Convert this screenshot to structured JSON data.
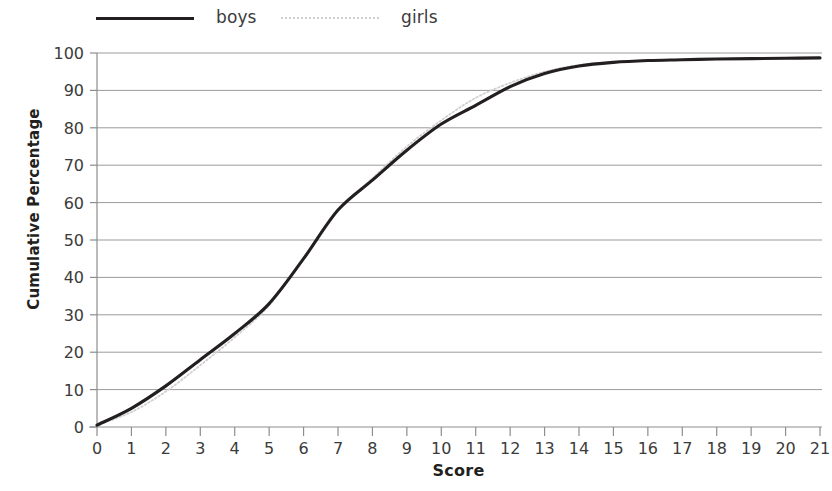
{
  "chart_data": {
    "type": "line",
    "title": "",
    "subtitle": "",
    "xlabel": "Score",
    "ylabel": "Cumulative Percentage",
    "xlim": [
      0,
      21
    ],
    "ylim": [
      0,
      100
    ],
    "x_ticks": [
      0,
      1,
      2,
      3,
      4,
      5,
      6,
      7,
      8,
      9,
      10,
      11,
      12,
      13,
      14,
      15,
      16,
      17,
      18,
      19,
      20,
      21
    ],
    "y_ticks": [
      0,
      10,
      20,
      30,
      40,
      50,
      60,
      70,
      80,
      90,
      100
    ],
    "grid": "horizontal",
    "legend_position": "top-left",
    "x": [
      0,
      1,
      2,
      3,
      4,
      5,
      6,
      7,
      8,
      9,
      10,
      11,
      12,
      13,
      14,
      15,
      16,
      17,
      18,
      19,
      20,
      21
    ],
    "series": [
      {
        "name": "boys",
        "color": "#231f20",
        "style": "solid",
        "values": [
          0.5,
          5,
          11,
          18,
          25,
          33,
          45,
          58,
          66,
          74,
          81,
          86,
          91,
          94.5,
          96.5,
          97.5,
          98,
          98.2,
          98.4,
          98.5,
          98.6,
          98.7
        ]
      },
      {
        "name": "girls",
        "color": "#d0d0d0",
        "style": "dotted",
        "values": [
          0.5,
          4,
          9.5,
          16.5,
          24,
          32.5,
          45,
          58,
          66.5,
          75,
          82,
          88,
          92,
          95,
          96.8,
          97.6,
          98,
          98.2,
          98.4,
          98.5,
          98.6,
          98.7
        ]
      }
    ]
  },
  "legend": {
    "entries": [
      {
        "label": "boys"
      },
      {
        "label": "girls"
      }
    ]
  },
  "axes": {
    "x_title": "Score",
    "y_title": "Cumulative Percentage"
  }
}
